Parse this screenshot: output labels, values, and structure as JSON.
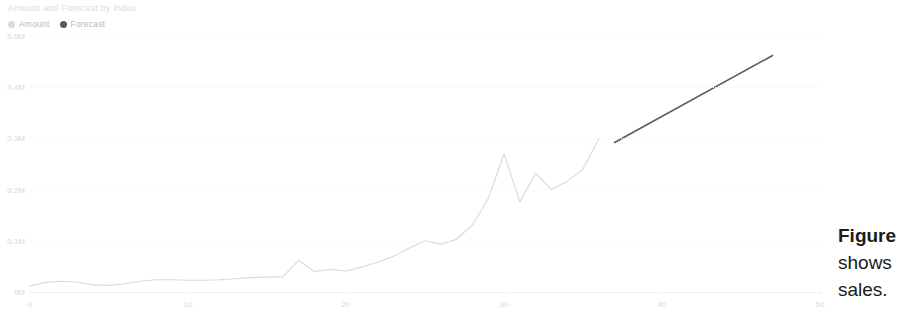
{
  "chart": {
    "title": "Amount and Forecast by Index",
    "legend": [
      {
        "label": "Amount",
        "color": "#d9d9d9",
        "marker": "circle-marker"
      },
      {
        "label": "Forecast",
        "color": "#5a5a5a",
        "marker": "circle-marker"
      }
    ]
  },
  "overlay_text": {
    "line1": "Figure",
    "line2": "shows",
    "line3": "sales."
  },
  "chart_data": {
    "type": "line",
    "title": "Amount and Forecast by Index",
    "xlabel": "",
    "ylabel": "",
    "xlim": [
      0,
      50
    ],
    "ylim": [
      0,
      0.5
    ],
    "grid": true,
    "legend_position": "top-left",
    "xticks": [
      0,
      10,
      20,
      30,
      40,
      50
    ],
    "xtick_labels": [
      "0",
      "10",
      "20",
      "30",
      "40",
      "50"
    ],
    "yticks": [
      0,
      0.1,
      0.2,
      0.3,
      0.4,
      0.5
    ],
    "ytick_labels": [
      "0M",
      "0.1M",
      "0.2M",
      "0.3M",
      "0.4M",
      "0.5M"
    ],
    "series": [
      {
        "name": "Amount",
        "color": "#d9d9d9",
        "x": [
          0,
          1,
          2,
          3,
          4,
          5,
          6,
          7,
          8,
          9,
          10,
          11,
          12,
          13,
          14,
          15,
          16,
          17,
          18,
          19,
          20,
          21,
          22,
          23,
          24,
          25,
          26,
          27,
          28,
          29,
          30,
          31,
          32,
          33,
          34,
          35,
          36
        ],
        "values": [
          0.012,
          0.019,
          0.021,
          0.019,
          0.014,
          0.013,
          0.016,
          0.021,
          0.024,
          0.024,
          0.023,
          0.023,
          0.024,
          0.026,
          0.028,
          0.029,
          0.03,
          0.062,
          0.04,
          0.044,
          0.041,
          0.049,
          0.058,
          0.07,
          0.086,
          0.1,
          0.093,
          0.103,
          0.131,
          0.182,
          0.27,
          0.176,
          0.232,
          0.2,
          0.216,
          0.24,
          0.3
        ]
      },
      {
        "name": "Forecast",
        "color": "#5a5a5a",
        "x": [
          37,
          47
        ],
        "values": [
          0.292,
          0.462
        ]
      }
    ]
  }
}
